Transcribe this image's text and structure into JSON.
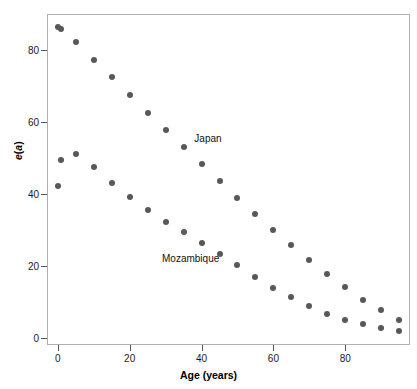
{
  "chart_data": {
    "type": "scatter",
    "title": "",
    "xlabel": "Age (years)",
    "ylabel": "e(a)",
    "xlim": [
      -3,
      98
    ],
    "ylim": [
      -2,
      90
    ],
    "xticks": [
      0,
      20,
      40,
      60,
      80
    ],
    "yticks": [
      0,
      20,
      40,
      60,
      80
    ],
    "xtick_labels": [
      "0",
      "20",
      "40",
      "60",
      "80"
    ],
    "ytick_labels": [
      "0",
      "20",
      "40",
      "60",
      "80"
    ],
    "grid": false,
    "legend": "inline-annotations",
    "marker_color": "#585858",
    "frame_color": "#b0b0b0",
    "x": [
      0,
      1,
      5,
      10,
      15,
      20,
      25,
      30,
      35,
      40,
      45,
      50,
      55,
      60,
      65,
      70,
      75,
      80,
      85,
      90,
      95
    ],
    "series": [
      {
        "name": "Japan",
        "values": [
          86.5,
          85.8,
          82.1,
          77.3,
          72.4,
          67.5,
          62.6,
          57.7,
          52.9,
          48.2,
          43.5,
          38.9,
          34.4,
          30.0,
          25.7,
          21.6,
          17.7,
          14.0,
          10.6,
          7.6,
          5.0
        ]
      },
      {
        "name": "Mozambique",
        "values": [
          42.3,
          49.5,
          51.1,
          47.6,
          43.1,
          39.0,
          35.4,
          32.2,
          29.4,
          26.4,
          23.3,
          20.1,
          16.8,
          13.9,
          11.3,
          8.8,
          6.7,
          5.0,
          3.8,
          2.7,
          1.9
        ]
      }
    ],
    "annotations": [
      {
        "text": "Japan",
        "x": 38,
        "y": 55
      },
      {
        "text": "Mozambique",
        "x": 29,
        "y": 21.5
      }
    ]
  }
}
